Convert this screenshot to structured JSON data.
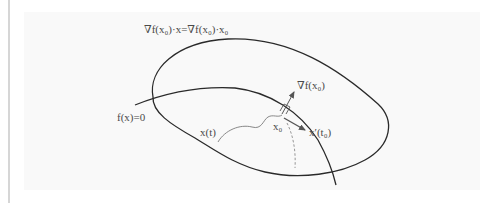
{
  "figure": {
    "labels": {
      "tangent_plane": "∇f(x₀)·x=∇f(x₀)·x₀",
      "surface": "f(x)=0",
      "gradient": "∇f(x₀)",
      "curve": "x(t)",
      "point": "x₀",
      "tangent_vector": "x′(t₀)"
    },
    "colors": {
      "panel_bg": "#f9f9f9",
      "stroke": "#2a2a2a",
      "arrow": "#555555",
      "dashed": "#8a8a8a",
      "side_rule": "#d6d6d6"
    }
  }
}
